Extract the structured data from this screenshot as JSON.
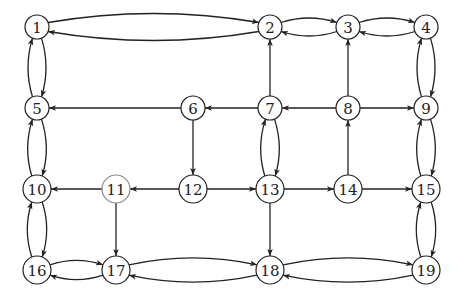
{
  "graph": {
    "type": "directed-graph",
    "colors": {
      "stroke": "#222222",
      "light_stroke": "#888888",
      "background": "#ffffff"
    },
    "nodes": [
      {
        "id": "1",
        "label": "1",
        "row": 0,
        "col": 0
      },
      {
        "id": "2",
        "label": "2",
        "row": 0,
        "col": 3
      },
      {
        "id": "3",
        "label": "3",
        "row": 0,
        "col": 4
      },
      {
        "id": "4",
        "label": "4",
        "row": 0,
        "col": 5
      },
      {
        "id": "5",
        "label": "5",
        "row": 1,
        "col": 0
      },
      {
        "id": "6",
        "label": "6",
        "row": 1,
        "col": 2
      },
      {
        "id": "7",
        "label": "7",
        "row": 1,
        "col": 3
      },
      {
        "id": "8",
        "label": "8",
        "row": 1,
        "col": 4
      },
      {
        "id": "9",
        "label": "9",
        "row": 1,
        "col": 5
      },
      {
        "id": "10",
        "label": "10",
        "row": 2,
        "col": 0
      },
      {
        "id": "11",
        "label": "11",
        "row": 2,
        "col": 1,
        "style": "light"
      },
      {
        "id": "12",
        "label": "12",
        "row": 2,
        "col": 2
      },
      {
        "id": "13",
        "label": "13",
        "row": 2,
        "col": 3
      },
      {
        "id": "14",
        "label": "14",
        "row": 2,
        "col": 4
      },
      {
        "id": "15",
        "label": "15",
        "row": 2,
        "col": 5
      },
      {
        "id": "16",
        "label": "16",
        "row": 3,
        "col": 0
      },
      {
        "id": "17",
        "label": "17",
        "row": 3,
        "col": 1
      },
      {
        "id": "18",
        "label": "18",
        "row": 3,
        "col": 3
      },
      {
        "id": "19",
        "label": "19",
        "row": 3,
        "col": 5
      }
    ],
    "edges": [
      {
        "from": "1",
        "to": "2",
        "bidirectional_pair": true
      },
      {
        "from": "2",
        "to": "1",
        "bidirectional_pair": true
      },
      {
        "from": "2",
        "to": "3",
        "bidirectional_pair": true
      },
      {
        "from": "3",
        "to": "2",
        "bidirectional_pair": true
      },
      {
        "from": "3",
        "to": "4",
        "bidirectional_pair": true
      },
      {
        "from": "4",
        "to": "3",
        "bidirectional_pair": true
      },
      {
        "from": "1",
        "to": "5",
        "bidirectional_pair": true
      },
      {
        "from": "5",
        "to": "1",
        "bidirectional_pair": true
      },
      {
        "from": "4",
        "to": "9",
        "bidirectional_pair": true
      },
      {
        "from": "9",
        "to": "4",
        "bidirectional_pair": true
      },
      {
        "from": "5",
        "to": "10",
        "bidirectional_pair": true
      },
      {
        "from": "10",
        "to": "5",
        "bidirectional_pair": true
      },
      {
        "from": "9",
        "to": "15",
        "bidirectional_pair": true
      },
      {
        "from": "15",
        "to": "9",
        "bidirectional_pair": true
      },
      {
        "from": "10",
        "to": "16",
        "bidirectional_pair": true
      },
      {
        "from": "16",
        "to": "10",
        "bidirectional_pair": true
      },
      {
        "from": "15",
        "to": "19",
        "bidirectional_pair": true
      },
      {
        "from": "19",
        "to": "15",
        "bidirectional_pair": true
      },
      {
        "from": "7",
        "to": "13",
        "bidirectional_pair": true
      },
      {
        "from": "13",
        "to": "7",
        "bidirectional_pair": true
      },
      {
        "from": "16",
        "to": "17",
        "bidirectional_pair": true
      },
      {
        "from": "17",
        "to": "16",
        "bidirectional_pair": true
      },
      {
        "from": "17",
        "to": "18",
        "bidirectional_pair": true
      },
      {
        "from": "18",
        "to": "17",
        "bidirectional_pair": true
      },
      {
        "from": "18",
        "to": "19",
        "bidirectional_pair": true
      },
      {
        "from": "19",
        "to": "18",
        "bidirectional_pair": true
      },
      {
        "from": "6",
        "to": "5"
      },
      {
        "from": "7",
        "to": "6"
      },
      {
        "from": "8",
        "to": "7"
      },
      {
        "from": "8",
        "to": "9"
      },
      {
        "from": "7",
        "to": "2"
      },
      {
        "from": "8",
        "to": "3"
      },
      {
        "from": "6",
        "to": "12"
      },
      {
        "from": "12",
        "to": "11"
      },
      {
        "from": "11",
        "to": "10"
      },
      {
        "from": "12",
        "to": "13"
      },
      {
        "from": "13",
        "to": "14"
      },
      {
        "from": "14",
        "to": "15"
      },
      {
        "from": "14",
        "to": "8"
      },
      {
        "from": "11",
        "to": "17"
      },
      {
        "from": "13",
        "to": "18"
      }
    ]
  }
}
